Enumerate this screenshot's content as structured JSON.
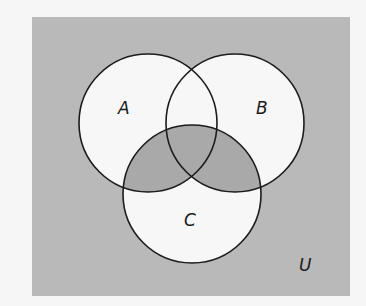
{
  "diagram": {
    "type": "venn",
    "universe": {
      "label": "U",
      "rect": {
        "x": 32,
        "y": 17,
        "width": 318,
        "height": 279
      },
      "fill": "#b9b9b9",
      "label_pos": {
        "x": 299,
        "y": 271
      }
    },
    "sets": [
      {
        "label": "A",
        "cx": 148,
        "cy": 123,
        "r": 69,
        "label_pos": {
          "x": 118,
          "y": 114
        }
      },
      {
        "label": "B",
        "cx": 235,
        "cy": 123,
        "r": 69,
        "label_pos": {
          "x": 256,
          "y": 114
        }
      },
      {
        "label": "C",
        "cx": 192,
        "cy": 194,
        "r": 69,
        "label_pos": {
          "x": 184,
          "y": 226
        }
      }
    ],
    "circle_fill": "#f7f7f7",
    "shaded_region": "(A ∩ C) ∪ (B ∩ C)",
    "shaded_fill": "#a9a9a9",
    "stroke": "#1c1c1c"
  }
}
